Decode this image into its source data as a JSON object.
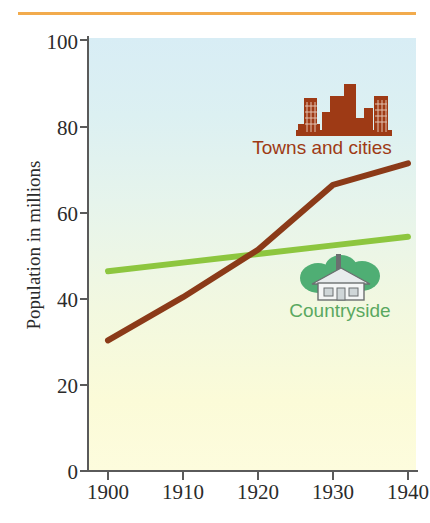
{
  "figure": {
    "caption": "FIGURE 2",
    "rule_color": "#f2ab4d"
  },
  "chart_data": {
    "type": "line",
    "title": "",
    "xlabel": "",
    "ylabel": "Population in millions",
    "x": [
      1900,
      1910,
      1920,
      1930,
      1940
    ],
    "xlim": [
      1900,
      1940
    ],
    "ylim": [
      0,
      100
    ],
    "xticks": [
      "1900",
      "1910",
      "1920",
      "1930",
      "1940"
    ],
    "yticks": [
      "0",
      "20",
      "40",
      "60",
      "80",
      "100"
    ],
    "grid": false,
    "legend_position": "inside-plot",
    "series": [
      {
        "name": "Towns and cities",
        "color": "#8b3a18",
        "values": [
          30,
          40,
          51,
          66,
          71
        ]
      },
      {
        "name": "Countryside",
        "color": "#8dc63f",
        "values": [
          46,
          48,
          50,
          52,
          54
        ]
      }
    ],
    "annotations": [
      "Lines cross at approximately 1917 at 49 million"
    ]
  },
  "legend": {
    "city": {
      "label": "Towns and cities",
      "icon": "city-skyline-icon",
      "color": "#9e3a15"
    },
    "country": {
      "label": "Countryside",
      "icon": "cottage-icon",
      "color": "#5aa860"
    }
  },
  "colors": {
    "plot_top": "#d8edf5",
    "plot_bottom": "#fdfcdd",
    "axis": "#5a5a5a",
    "caption": "#e8912b"
  }
}
